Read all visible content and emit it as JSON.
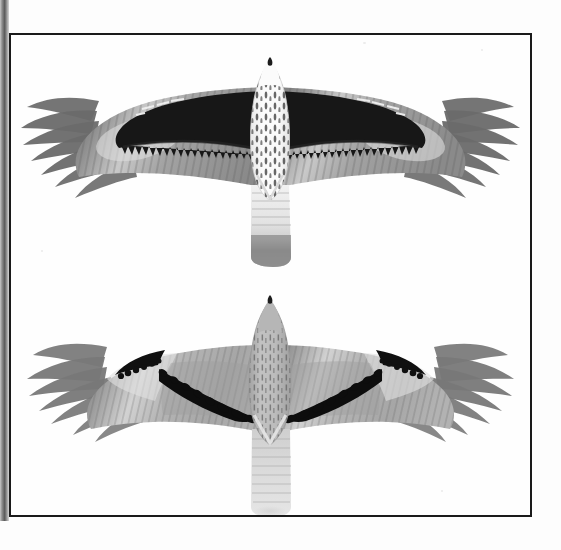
{
  "plate": {
    "medium": "halftone grayscale field-guide plate",
    "frame_color": "#1a1a1a",
    "background_color": "#ffffff",
    "gutter_shadow_color": "#5a5a5a",
    "figure_count": 2,
    "orientation": "two raptors in flight, ventral (underside) view, wings fully spread"
  },
  "figures": [
    {
      "id": "upper-bird",
      "position": "upper half of plate",
      "view": "underside, wings spread, tail closed",
      "head": {
        "color": "#f7f7f7",
        "note": "white head with fine dark streaks",
        "beak_color": "#1c1c1c"
      },
      "body": {
        "color": "#f5f5f5",
        "markings": "dense dark teardrop streaks on white underparts"
      },
      "wing_lining": {
        "color": "#141414",
        "note": "solid blackish inner wing coverts / broad dark leading block"
      },
      "flight_feathers": {
        "color": "#9a9a9a",
        "note": "grey barred remiges with pale carpal panel"
      },
      "wingtips": {
        "color": "#6e6e6e",
        "note": "fingered dark primary tips"
      },
      "tail": {
        "color": "#ededed",
        "band_color": "#767676",
        "note": "pale tail with broad dark terminal band"
      }
    },
    {
      "id": "lower-bird",
      "position": "lower half of plate",
      "view": "underside, wings spread, tail closed",
      "head": {
        "color": "#b9b9b9",
        "note": "uniformly grey-brown streaked head",
        "beak_color": "#1c1c1c"
      },
      "body": {
        "color": "#b0b0b0",
        "markings": "fine dark vertical streaking over grey underparts"
      },
      "wing_lining": {
        "color": "#a8a8a8",
        "note": "plain greyish coverts crossed by a black diagonal bar"
      },
      "flight_feathers": {
        "color": "#a4a4a4",
        "note": "paler barred remiges, pale carpal crescent"
      },
      "wingtips": {
        "color": "#757575",
        "note": "fingered dark primary tips"
      },
      "tail": {
        "color": "#d7d7d7",
        "band_color": "#bdbdbd",
        "note": "pale narrowly barred tail, no bold terminal band"
      },
      "diagnostic_marks": "bold black curved line along leading edge of each hand plus a black diagonal covert bar running inward to the body"
    }
  ],
  "labels": {
    "caption": "",
    "figure_numbers": []
  }
}
